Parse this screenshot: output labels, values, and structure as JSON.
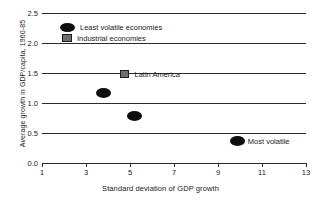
{
  "chart_data": {
    "type": "scatter",
    "title": "",
    "xlabel": "Standard deviation of GDP growth",
    "ylabel": "Average growth in GDP/capita, 1960-85",
    "xlim": [
      1,
      13
    ],
    "ylim": [
      0.0,
      2.5
    ],
    "xticks": [
      1,
      3,
      5,
      7,
      9,
      11,
      13
    ],
    "xtick_labels": [
      "1",
      "3",
      "5",
      "7",
      "9",
      "11",
      "13"
    ],
    "yticks": [
      0.0,
      0.5,
      1.0,
      1.5,
      2.0,
      2.5
    ],
    "ytick_labels": [
      "0.0",
      "0.5",
      "1.0",
      "1.5",
      "2.0",
      "2.5"
    ],
    "grid": "horizontal",
    "legend_position": "upper-left-inside",
    "legend": [
      {
        "label": "Least volatile economies",
        "marker": "ellipse",
        "color": "#0e0e0e"
      },
      {
        "label": "Industrial economies",
        "marker": "square",
        "color": "#6f6f6f"
      }
    ],
    "series": [
      {
        "name": "Least volatile economies",
        "marker": "ellipse",
        "color": "#0e0e0e",
        "points": [
          {
            "x": 3.8,
            "y": 1.17,
            "label": ""
          },
          {
            "x": 5.2,
            "y": 0.78,
            "label": ""
          },
          {
            "x": 9.9,
            "y": 0.37,
            "label": "Most volatile"
          }
        ]
      },
      {
        "name": "Industrial economies",
        "marker": "square",
        "color": "#6f6f6f",
        "points": [
          {
            "x": 4.75,
            "y": 1.48,
            "label": "Latin America"
          }
        ]
      }
    ],
    "annotations": [
      {
        "text": "Latin America",
        "x": 4.75,
        "y": 1.48
      },
      {
        "text": "Most volatile",
        "x": 9.9,
        "y": 0.37
      }
    ]
  }
}
